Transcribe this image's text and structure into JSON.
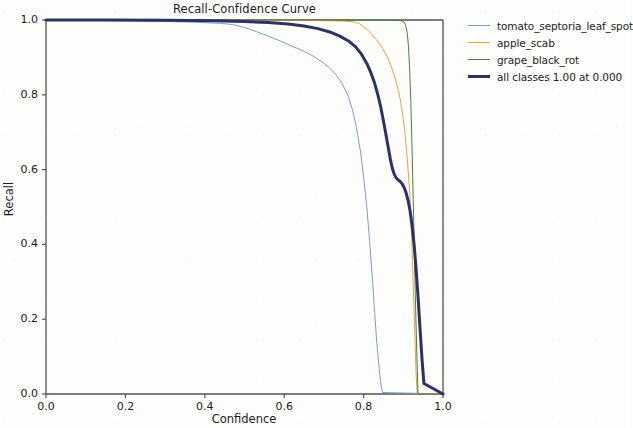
{
  "chart_data": {
    "type": "line",
    "title": "Recall-Confidence Curve",
    "xlabel": "Confidence",
    "ylabel": "Recall",
    "xlim": [
      0.0,
      1.0
    ],
    "ylim": [
      0.0,
      1.0
    ],
    "xticks": [
      "0.0",
      "0.2",
      "0.4",
      "0.6",
      "0.8",
      "1.0"
    ],
    "yticks": [
      "0.0",
      "0.2",
      "0.4",
      "0.6",
      "0.8",
      "1.0"
    ],
    "grid": false,
    "legend_position": "outside-right-top",
    "series": [
      {
        "name": "tomato_septoria_leaf_spot",
        "color": "#7a9fc4",
        "width": 1.0,
        "x": [
          0.0,
          0.1,
          0.2,
          0.3,
          0.38,
          0.44,
          0.47,
          0.5,
          0.53,
          0.56,
          0.59,
          0.615,
          0.64,
          0.66,
          0.68,
          0.7,
          0.715,
          0.73,
          0.745,
          0.76,
          0.772,
          0.782,
          0.792,
          0.8,
          0.808,
          0.815,
          0.822,
          0.828,
          0.833,
          0.838,
          0.842,
          0.845,
          0.848,
          1.0
        ],
        "y": [
          1.0,
          0.999,
          0.998,
          0.996,
          0.994,
          0.991,
          0.988,
          0.98,
          0.969,
          0.957,
          0.944,
          0.932,
          0.921,
          0.911,
          0.899,
          0.884,
          0.871,
          0.854,
          0.832,
          0.8,
          0.76,
          0.712,
          0.65,
          0.58,
          0.5,
          0.41,
          0.31,
          0.215,
          0.14,
          0.082,
          0.04,
          0.016,
          0.004,
          0.0
        ]
      },
      {
        "name": "apple_scab",
        "color": "#e8a33d",
        "width": 1.0,
        "x": [
          0.0,
          0.2,
          0.4,
          0.55,
          0.65,
          0.71,
          0.75,
          0.775,
          0.79,
          0.8,
          0.812,
          0.822,
          0.832,
          0.84,
          0.848,
          0.855,
          0.862,
          0.868,
          0.874,
          0.88,
          0.886,
          0.892,
          0.898,
          0.904,
          0.91,
          0.916,
          0.921,
          0.925,
          0.929,
          0.932,
          0.935,
          1.0
        ],
        "y": [
          1.0,
          1.0,
          1.0,
          0.999,
          0.999,
          0.998,
          0.997,
          0.995,
          0.99,
          0.982,
          0.972,
          0.96,
          0.948,
          0.936,
          0.924,
          0.91,
          0.896,
          0.88,
          0.862,
          0.842,
          0.818,
          0.79,
          0.75,
          0.7,
          0.63,
          0.54,
          0.42,
          0.29,
          0.16,
          0.06,
          0.0,
          0.0
        ]
      },
      {
        "name": "grape_black_rot",
        "color": "#4f7a4f",
        "width": 1.0,
        "x": [
          0.0,
          0.3,
          0.6,
          0.78,
          0.85,
          0.88,
          0.895,
          0.902,
          0.906,
          0.91,
          0.913,
          0.916,
          0.919,
          0.922,
          0.925,
          0.928,
          0.931,
          0.934,
          0.937,
          1.0
        ],
        "y": [
          1.0,
          1.0,
          1.0,
          1.0,
          1.0,
          0.999,
          0.998,
          0.995,
          0.985,
          0.965,
          0.93,
          0.87,
          0.78,
          0.66,
          0.52,
          0.37,
          0.23,
          0.11,
          0.0,
          0.0
        ]
      },
      {
        "name": "all classes 1.00 at 0.000",
        "color": "#2b3366",
        "width": 3.0,
        "x": [
          0.0,
          0.15,
          0.3,
          0.42,
          0.5,
          0.56,
          0.61,
          0.65,
          0.685,
          0.715,
          0.74,
          0.762,
          0.78,
          0.795,
          0.808,
          0.818,
          0.828,
          0.836,
          0.843,
          0.85,
          0.856,
          0.862,
          0.867,
          0.872,
          0.877,
          0.882,
          0.887,
          0.892,
          0.897,
          0.902,
          0.907,
          0.912,
          0.917,
          0.922,
          0.927,
          0.932,
          0.937,
          0.942,
          0.947,
          0.952,
          1.0
        ],
        "y": [
          1.0,
          1.0,
          0.999,
          0.998,
          0.996,
          0.993,
          0.989,
          0.984,
          0.977,
          0.968,
          0.957,
          0.944,
          0.928,
          0.908,
          0.884,
          0.86,
          0.83,
          0.8,
          0.768,
          0.73,
          0.695,
          0.66,
          0.63,
          0.605,
          0.588,
          0.578,
          0.572,
          0.568,
          0.562,
          0.552,
          0.538,
          0.518,
          0.49,
          0.452,
          0.402,
          0.338,
          0.262,
          0.178,
          0.095,
          0.028,
          0.0
        ]
      }
    ]
  },
  "legend": {
    "items": [
      {
        "label": "tomato_septoria_leaf_spot"
      },
      {
        "label": "apple_scab"
      },
      {
        "label": "grape_black_rot"
      },
      {
        "label": "all classes 1.00 at 0.000"
      }
    ]
  },
  "colors": {
    "tomato_septoria_leaf_spot": "#7a9fc4",
    "apple_scab": "#e8a33d",
    "grape_black_rot": "#4f7a4f",
    "all_classes": "#2b3366",
    "axis": "#55514f",
    "text": "#1b1b1b",
    "background": "#fdfdfc"
  }
}
